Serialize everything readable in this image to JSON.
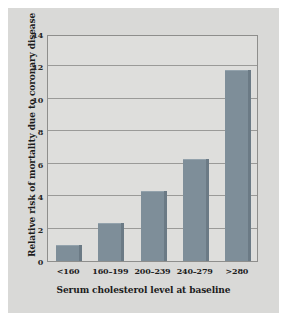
{
  "chart_data": {
    "type": "bar",
    "title": "",
    "subtitle": "",
    "xlabel": "Serum cholesterol level at baseline",
    "ylabel": "Relative risk of mortality due to coronary disease",
    "categories": [
      "<160",
      "160–199",
      "200–239",
      "240–279",
      ">280"
    ],
    "values": [
      1.0,
      2.35,
      4.3,
      6.3,
      11.8
    ],
    "ylim": [
      0,
      14
    ],
    "yticks": [
      0,
      2,
      4,
      6,
      8,
      10,
      12,
      14
    ],
    "ytick_labels": [
      "0",
      "2",
      "4",
      "6",
      "8",
      "10",
      "12",
      "14"
    ],
    "grid": true,
    "legend": false,
    "legend_position": "none",
    "series": [
      {
        "name": "Relative risk of mortality due to coronary disease",
        "values": [
          1.0,
          2.35,
          4.3,
          6.3,
          11.8
        ]
      }
    ]
  },
  "colors": {
    "page_background": "#ffffff",
    "panel_background": "#d9d9d7",
    "plot_background": "#dededc",
    "bar_fill": "#7e8e99",
    "bar_shadow": "#6b7a85",
    "gridline": "#9a9a98",
    "axis_frame": "#8e8e8c",
    "text": "#1c1c1c"
  }
}
